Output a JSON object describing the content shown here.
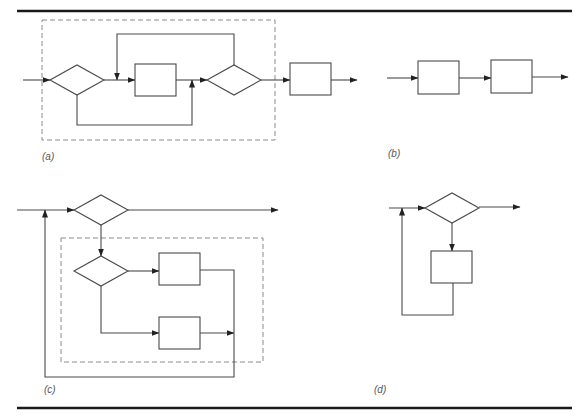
{
  "figure": {
    "colors": {
      "stroke": "#4a4a4a",
      "rule": "#1a1a1a",
      "dashed": "#8a8a8a",
      "background": "#ffffff"
    },
    "rules": [
      {
        "x1": 17,
        "y1": 11,
        "x2": 572,
        "y2": 11
      },
      {
        "x1": 17,
        "y1": 408,
        "x2": 572,
        "y2": 408
      }
    ],
    "panels": [
      {
        "id": "a",
        "label": "(a)",
        "label_pos": {
          "x": 42,
          "y": 151
        },
        "dashed_box": {
          "x": 42,
          "y": 20,
          "w": 233,
          "h": 120
        },
        "diamonds": [
          {
            "cx": 77,
            "cy": 80,
            "hw": 27,
            "hh": 15
          },
          {
            "cx": 234,
            "cy": 80,
            "hw": 27,
            "hh": 15
          }
        ],
        "boxes": [
          {
            "x": 135,
            "y": 64,
            "w": 41,
            "h": 32
          },
          {
            "x": 290,
            "y": 63,
            "w": 41,
            "h": 32
          }
        ],
        "arrows": [
          {
            "pts": [
              [
                23,
                80
              ],
              [
                50,
                80
              ]
            ],
            "head": true
          },
          {
            "pts": [
              [
                104,
                80
              ],
              [
                135,
                80
              ]
            ],
            "head": true
          },
          {
            "pts": [
              [
                176,
                80
              ],
              [
                207,
                80
              ]
            ],
            "head": true
          },
          {
            "pts": [
              [
                234,
                65
              ],
              [
                234,
                34
              ],
              [
                117,
                34
              ],
              [
                117,
                80
              ]
            ],
            "head": true
          },
          {
            "pts": [
              [
                77,
                95
              ],
              [
                77,
                125
              ],
              [
                192,
                125
              ],
              [
                192,
                80
              ]
            ],
            "head": true
          },
          {
            "pts": [
              [
                261,
                80
              ],
              [
                290,
                80
              ]
            ],
            "head": true
          },
          {
            "pts": [
              [
                331,
                80
              ],
              [
                357,
                80
              ]
            ],
            "head": true
          }
        ]
      },
      {
        "id": "b",
        "label": "(b)",
        "label_pos": {
          "x": 388,
          "y": 148
        },
        "boxes": [
          {
            "x": 418,
            "y": 61,
            "w": 41,
            "h": 33
          },
          {
            "x": 491,
            "y": 60,
            "w": 41,
            "h": 33
          }
        ],
        "arrows": [
          {
            "pts": [
              [
                387,
                78
              ],
              [
                418,
                78
              ]
            ],
            "head": true
          },
          {
            "pts": [
              [
                459,
                78
              ],
              [
                491,
                78
              ]
            ],
            "head": true
          },
          {
            "pts": [
              [
                532,
                77
              ],
              [
                568,
                77
              ]
            ],
            "head": true
          }
        ]
      },
      {
        "id": "c",
        "label": "(c)",
        "label_pos": {
          "x": 44,
          "y": 384
        },
        "dashed_box": {
          "x": 61,
          "y": 238,
          "w": 202,
          "h": 124
        },
        "diamonds": [
          {
            "cx": 101,
            "cy": 210,
            "hw": 27,
            "hh": 15
          },
          {
            "cx": 101,
            "cy": 271,
            "hw": 27,
            "hh": 15
          }
        ],
        "boxes": [
          {
            "x": 159,
            "y": 253,
            "w": 41,
            "h": 32
          },
          {
            "x": 159,
            "y": 317,
            "w": 41,
            "h": 32
          }
        ],
        "arrows": [
          {
            "pts": [
              [
                17,
                210
              ],
              [
                74,
                210
              ]
            ],
            "head": true
          },
          {
            "pts": [
              [
                128,
                210
              ],
              [
                278,
                210
              ]
            ],
            "head": true
          },
          {
            "pts": [
              [
                101,
                225
              ],
              [
                101,
                256
              ]
            ],
            "head": true
          },
          {
            "pts": [
              [
                128,
                271
              ],
              [
                159,
                271
              ]
            ],
            "head": true
          },
          {
            "pts": [
              [
                101,
                286
              ],
              [
                101,
                333
              ],
              [
                159,
                333
              ]
            ],
            "head": true
          },
          {
            "pts": [
              [
                200,
                333
              ],
              [
                234,
                333
              ]
            ],
            "head": true
          },
          {
            "pts": [
              [
                200,
                270
              ],
              [
                234,
                270
              ],
              [
                234,
                377
              ],
              [
                45,
                377
              ],
              [
                45,
                210
              ]
            ],
            "head": true
          }
        ]
      },
      {
        "id": "d",
        "label": "(d)",
        "label_pos": {
          "x": 374,
          "y": 384
        },
        "diamonds": [
          {
            "cx": 452,
            "cy": 208,
            "hw": 27,
            "hh": 15
          }
        ],
        "boxes": [
          {
            "x": 431,
            "y": 251,
            "w": 41,
            "h": 32
          }
        ],
        "arrows": [
          {
            "pts": [
              [
                389,
                208
              ],
              [
                425,
                208
              ]
            ],
            "head": true
          },
          {
            "pts": [
              [
                479,
                207
              ],
              [
                520,
                207
              ]
            ],
            "head": true
          },
          {
            "pts": [
              [
                452,
                223
              ],
              [
                452,
                251
              ]
            ],
            "head": true
          },
          {
            "pts": [
              [
                453,
                283
              ],
              [
                453,
                315
              ],
              [
                402,
                315
              ],
              [
                402,
                208
              ]
            ],
            "head": true
          }
        ]
      }
    ]
  }
}
